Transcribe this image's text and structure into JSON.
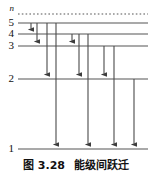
{
  "figure": {
    "caption_number": "图 3.28",
    "caption_title": "能级间跃迁",
    "caption_full": "图 3.28　能级间跃迁"
  },
  "axis": {
    "quantum_number_symbol": "n"
  },
  "chart_data": {
    "type": "diagram",
    "subtype": "energy-level-transition",
    "title": "能级间跃迁",
    "figure_number": "图 3.28",
    "ylabel": "n",
    "grid": false,
    "legend": null,
    "levels": [
      {
        "label": "n",
        "name": "ionization-limit",
        "y": 14,
        "style": "dashed",
        "x_start": 18,
        "x_end": 148
      },
      {
        "label": "5",
        "name": "level-5",
        "y": 23,
        "style": "solid",
        "x_start": 18,
        "x_end": 148
      },
      {
        "label": "4",
        "name": "level-4",
        "y": 34,
        "style": "solid",
        "x_start": 18,
        "x_end": 148
      },
      {
        "label": "3",
        "name": "level-3",
        "y": 46,
        "style": "solid",
        "x_start": 18,
        "x_end": 148
      },
      {
        "label": "2",
        "name": "level-2",
        "y": 79,
        "style": "solid",
        "x_start": 18,
        "x_end": 148
      },
      {
        "label": "1",
        "name": "level-1",
        "y": 149,
        "style": "solid",
        "x_start": 18,
        "x_end": 148
      }
    ],
    "transitions": [
      {
        "name": "transition-5-to-4",
        "from": 5,
        "to": 4,
        "x": 31,
        "y_start": 23,
        "y_end": 34
      },
      {
        "name": "transition-5-to-3",
        "from": 5,
        "to": 3,
        "x": 37,
        "y_start": 23,
        "y_end": 46
      },
      {
        "name": "transition-5-to-2",
        "from": 5,
        "to": 2,
        "x": 47,
        "y_start": 23,
        "y_end": 79
      },
      {
        "name": "transition-5-to-1",
        "from": 5,
        "to": 1,
        "x": 56,
        "y_start": 23,
        "y_end": 149
      },
      {
        "name": "transition-4-to-3",
        "from": 4,
        "to": 3,
        "x": 72,
        "y_start": 34,
        "y_end": 46
      },
      {
        "name": "transition-4-to-2",
        "from": 4,
        "to": 2,
        "x": 79,
        "y_start": 34,
        "y_end": 79
      },
      {
        "name": "transition-4-to-1",
        "from": 4,
        "to": 1,
        "x": 88,
        "y_start": 34,
        "y_end": 149
      },
      {
        "name": "transition-3-to-2",
        "from": 3,
        "to": 2,
        "x": 104,
        "y_start": 46,
        "y_end": 79
      },
      {
        "name": "transition-3-to-1",
        "from": 3,
        "to": 1,
        "x": 114,
        "y_start": 46,
        "y_end": 149
      },
      {
        "name": "transition-2-to-1",
        "from": 2,
        "to": 1,
        "x": 134,
        "y_start": 79,
        "y_end": 149
      }
    ],
    "colors": {
      "level_line": "#555555",
      "arrow": "#4a4a4a",
      "text": "#111111",
      "background": "#ffffff"
    }
  }
}
